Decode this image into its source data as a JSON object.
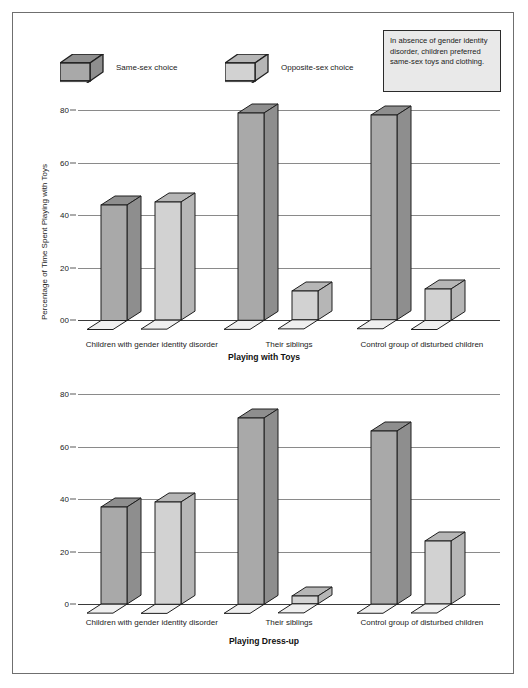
{
  "legend": {
    "entries": [
      {
        "label": "Same-sex choice",
        "icon": "bar-3d-dark-icon",
        "color": "#a9a9a9"
      },
      {
        "label": "Opposite-sex choice",
        "icon": "bar-3d-light-icon",
        "color": "#d2d2d2"
      }
    ]
  },
  "note": {
    "text": "In absence of gender identity disorder, children preferred same-sex toys and clothing."
  },
  "colors": {
    "series_same_sex_front": "#a9a9a9",
    "series_same_sex_side": "#8e8e8e",
    "series_opposite_sex_front": "#d2d2d2",
    "series_opposite_sex_side": "#b6b6b6",
    "outline": "#1e1e1e",
    "gridline": "#8a8a8a",
    "note_background": "#e9e9e9",
    "page_background": "#ffffff"
  },
  "chart_data": [
    {
      "id": "toys",
      "type": "bar",
      "title": "Playing with Toys",
      "xlabel": "",
      "ylabel": "Percentage of Time Spent Playing with Toys",
      "ylim": [
        0,
        80
      ],
      "grid": true,
      "legend_position": "top",
      "ticks": [
        "00",
        "20",
        "40",
        "60",
        "80"
      ],
      "tick_values": [
        0,
        20,
        40,
        60,
        80
      ],
      "categories": [
        "Children with gender identity disorder",
        "Their siblings",
        "Control group of disturbed children"
      ],
      "series": [
        {
          "name": "Same-sex choice",
          "values": [
            44,
            79,
            78
          ]
        },
        {
          "name": "Opposite-sex choice",
          "values": [
            45,
            11,
            12
          ]
        }
      ]
    },
    {
      "id": "dress",
      "type": "bar",
      "title": "Playing Dress-up",
      "xlabel": "",
      "ylabel": "Percentage of Time Spent Playing Dress-up",
      "ylim": [
        0,
        80
      ],
      "grid": true,
      "legend_position": "none",
      "ticks": [
        "0",
        "20",
        "40",
        "60",
        "80"
      ],
      "tick_values": [
        0,
        20,
        40,
        60,
        80
      ],
      "categories": [
        "Children with gender identity disorder",
        "Their siblings",
        "Control group of disturbed children"
      ],
      "series": [
        {
          "name": "Same-sex choice",
          "values": [
            37,
            71,
            66
          ]
        },
        {
          "name": "Opposite-sex choice",
          "values": [
            39,
            3,
            24
          ]
        }
      ]
    }
  ]
}
